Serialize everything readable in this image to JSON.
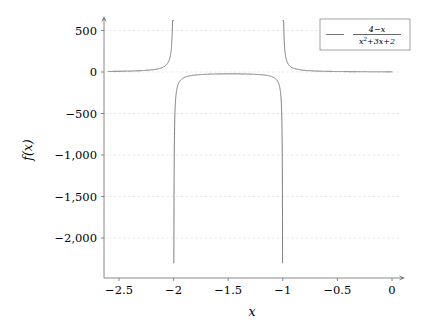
{
  "chart_data": {
    "type": "line",
    "title": "",
    "xlabel": "x",
    "ylabel": "f(x)",
    "legend": [
      {
        "label": "(4 - x) / (x^2 + 3x + 2)",
        "numerator": "4−x",
        "denominator_base": "x",
        "denominator_exp": "2",
        "denominator_rest": "+3x+2",
        "color": "#555555",
        "position": "top-right"
      }
    ],
    "xlim": [
      -2.6,
      0.0
    ],
    "ylim": [
      -2300,
      620
    ],
    "xticks": [
      -2.5,
      -2,
      -1.5,
      -1,
      -0.5,
      0
    ],
    "xticklabels": [
      "−2.5",
      "−2",
      "−1.5",
      "−1",
      "−0.5",
      "0"
    ],
    "yticks": [
      500,
      0,
      -500,
      -1000,
      -1500,
      -2000
    ],
    "yticklabels": [
      "500",
      "0",
      "−500",
      "−1,000",
      "−1,500",
      "−2,000"
    ],
    "grid": true,
    "grid_color": "#d9d9d9",
    "axis_color": "#7a7a7a",
    "curve_color": "#555555",
    "asymptotes": [
      -2,
      -1
    ],
    "function": "f(x) = (4 - x) / (x^2 + 3x + 2)",
    "sample_points": [
      {
        "x": -2.6,
        "y": 4.13
      },
      {
        "x": -2.5,
        "y": 8.67
      },
      {
        "x": -2.4,
        "y": 13.57
      },
      {
        "x": -2.3,
        "y": 21.08
      },
      {
        "x": -2.2,
        "y": 34.44
      },
      {
        "x": -2.1,
        "y": 64.2
      },
      {
        "x": -2.05,
        "y": 124.5
      },
      {
        "x": -2.02,
        "y": 306.9
      },
      {
        "x": -2.01,
        "y": 610.4
      },
      {
        "x": -1.99,
        "y": -610.4
      },
      {
        "x": -1.98,
        "y": -305.9
      },
      {
        "x": -1.95,
        "y": -120.9
      },
      {
        "x": -1.9,
        "y": -59.9
      },
      {
        "x": -1.8,
        "y": -29.0
      },
      {
        "x": -1.7,
        "y": -18.6
      },
      {
        "x": -1.5,
        "y": -11.0
      },
      {
        "x": -1.3,
        "y": -10.1
      },
      {
        "x": -1.2,
        "y": -13.0
      },
      {
        "x": -1.1,
        "y": -23.2
      },
      {
        "x": -1.05,
        "y": -44.4
      },
      {
        "x": -1.02,
        "y": -108.2
      },
      {
        "x": -1.005,
        "y": -415.0
      },
      {
        "x": -1.002,
        "y": -1000.0
      },
      {
        "x": -0.998,
        "y": 1000.0
      },
      {
        "x": -0.995,
        "y": 417.0
      },
      {
        "x": -0.99,
        "y": 207.1
      },
      {
        "x": -0.95,
        "y": 38.9
      },
      {
        "x": -0.9,
        "y": 17.9
      },
      {
        "x": -0.8,
        "y": 8.0
      },
      {
        "x": -0.6,
        "y": 3.3
      },
      {
        "x": -0.4,
        "y": 3.7
      },
      {
        "x": -0.2,
        "y": 2.9
      },
      {
        "x": 0.0,
        "y": 2.0
      }
    ]
  },
  "figure": {
    "background": "#ffffff",
    "width": 427,
    "height": 328
  }
}
